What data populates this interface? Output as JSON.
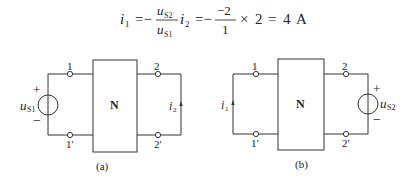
{
  "equation": {
    "lhs_var": "i",
    "lhs_sub": "1",
    "eq1": "=−",
    "frac1_num_var": "u",
    "frac1_num_sub": "S2",
    "frac1_den_var": "u",
    "frac1_den_sub": "S1",
    "mult_var": "i",
    "mult_sub": "2",
    "eq2": "=−",
    "frac2_num": "−2",
    "frac2_den": "1",
    "times": "×",
    "factor": "2",
    "eq3": "=",
    "result": "4",
    "unit": "A"
  },
  "circuit_a": {
    "caption": "(a)",
    "network_label": "N",
    "port1_top": "1",
    "port1_bottom": "1′",
    "port2_top": "2",
    "port2_bottom": "2′",
    "source_var": "u",
    "source_sub": "S1",
    "source_plus": "+",
    "source_minus": "−",
    "current_var": "i",
    "current_sub": "2"
  },
  "circuit_b": {
    "caption": "(b)",
    "network_label": "N",
    "port1_top": "1",
    "port1_bottom": "1′",
    "port2_top": "2",
    "port2_bottom": "2′",
    "source_var": "u",
    "source_sub": "S2",
    "source_plus": "+",
    "source_minus": "−",
    "current_var": "i",
    "current_sub": "1"
  },
  "colors": {
    "line": "#333333",
    "background": "#ffffff"
  }
}
